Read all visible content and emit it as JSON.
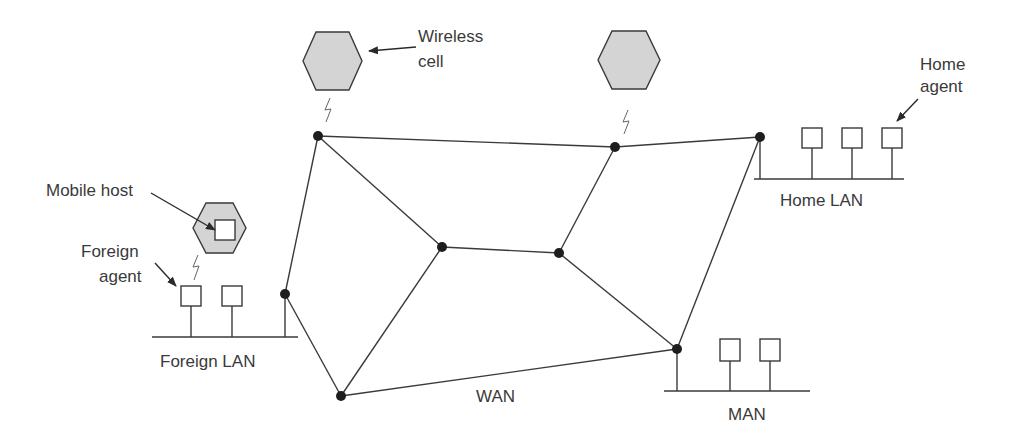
{
  "diagram": {
    "title": "",
    "labels": {
      "wireless_cell_line1": "Wireless",
      "wireless_cell_line2": "cell",
      "home_agent_line1": "Home",
      "home_agent_line2": "agent",
      "home_lan": "Home LAN",
      "mobile_host": "Mobile host",
      "foreign_agent_line1": "Foreign",
      "foreign_agent_line2": "agent",
      "foreign_lan": "Foreign LAN",
      "wan": "WAN",
      "man": "MAN"
    },
    "colors": {
      "cell_fill": "#d4d4d4",
      "line": "#3a3a3a",
      "node": "#1e1e1e"
    },
    "nodes": [
      {
        "id": "n1",
        "x": 318,
        "y": 136
      },
      {
        "id": "n2",
        "x": 615,
        "y": 147
      },
      {
        "id": "n3",
        "x": 760,
        "y": 137
      },
      {
        "id": "n4",
        "x": 442,
        "y": 247
      },
      {
        "id": "n5",
        "x": 559,
        "y": 253
      },
      {
        "id": "n6",
        "x": 285,
        "y": 294
      },
      {
        "id": "n7",
        "x": 341,
        "y": 396
      },
      {
        "id": "n8",
        "x": 677,
        "y": 349
      }
    ],
    "edges": [
      [
        "n1",
        "n2"
      ],
      [
        "n2",
        "n3"
      ],
      [
        "n1",
        "n4"
      ],
      [
        "n1",
        "n6"
      ],
      [
        "n2",
        "n5"
      ],
      [
        "n4",
        "n5"
      ],
      [
        "n4",
        "n7"
      ],
      [
        "n5",
        "n8"
      ],
      [
        "n3",
        "n8"
      ],
      [
        "n6",
        "n7"
      ],
      [
        "n7",
        "n8"
      ]
    ]
  }
}
